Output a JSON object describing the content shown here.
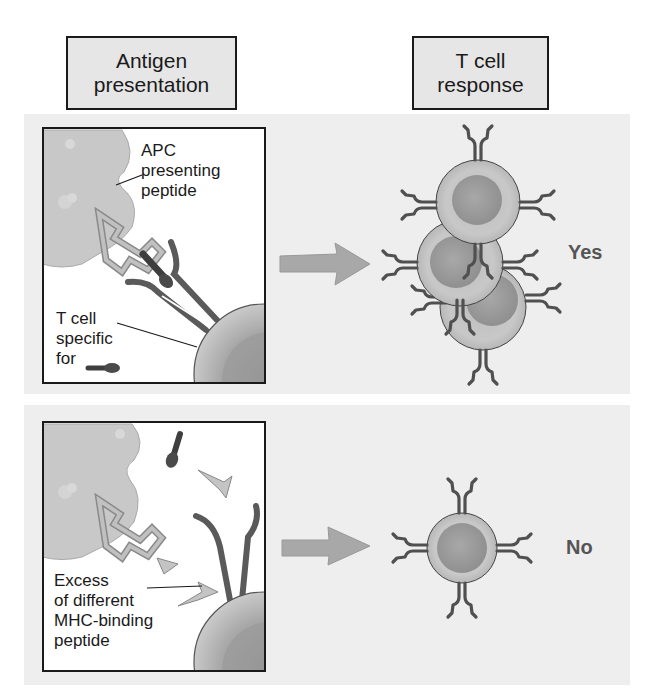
{
  "headers": {
    "antigen_presentation": [
      "Antigen",
      "presentation"
    ],
    "t_cell_response": [
      "T cell",
      "response"
    ]
  },
  "panel_top": {
    "apc_label": [
      "APC",
      "presenting",
      "peptide"
    ],
    "tcell_label": [
      "T cell",
      "specific",
      "for"
    ],
    "result": "Yes"
  },
  "panel_bottom": {
    "excess_label": [
      "Excess",
      "of different",
      "MHC-binding",
      "peptide"
    ],
    "result": "No"
  },
  "colors": {
    "panel_bg": "#eeeeee",
    "outline": "#1a1a1a",
    "apc": "#c8c8c8",
    "mhc": "#b4b4b4",
    "tcr": "#666666",
    "peptide": "#4a4a4a",
    "cell": "#bdbdbd",
    "nucleus": "#9a9a9a",
    "arrow": "#a8a8a8",
    "result_text": "#555555"
  }
}
